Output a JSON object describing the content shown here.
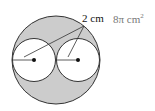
{
  "diagram": {
    "outer_circle": {
      "cx": 56,
      "cy": 60,
      "r": 44,
      "fill": "#cccccc"
    },
    "inner_circles": [
      {
        "cx": 34,
        "cy": 60,
        "r": 22,
        "fill": "#ffffff"
      },
      {
        "cx": 78,
        "cy": 60,
        "r": 22,
        "fill": "#ffffff"
      }
    ],
    "radius_label": "2 cm",
    "answer": "8π cm",
    "answer_exp": "2",
    "colors": {
      "shade": "#cccccc",
      "stroke": "#333333",
      "answer_text": "#777777"
    }
  }
}
